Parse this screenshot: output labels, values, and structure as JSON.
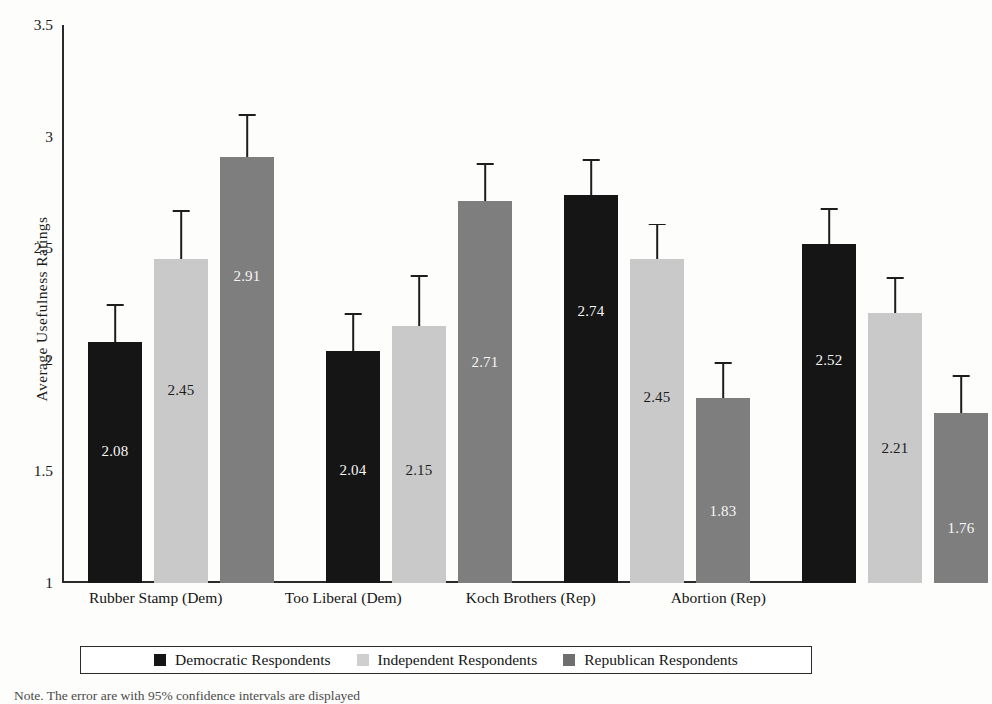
{
  "chart_data": {
    "type": "bar",
    "title": "",
    "xlabel": "",
    "ylabel": "Average Usefulness Ratings",
    "ylim": [
      1,
      3.5
    ],
    "yticks": [
      "1",
      "1.5",
      "2",
      "2.5",
      "3",
      "3.5"
    ],
    "grid": false,
    "legend_position": "bottom",
    "categories": [
      "Rubber Stamp (Dem)",
      "Too Liberal (Dem)",
      "Koch Brothers (Rep)",
      "Abortion (Rep)"
    ],
    "series": [
      {
        "name": "Democratic Respondents",
        "color": "#151515",
        "values": [
          2.08,
          2.04,
          2.74,
          2.52
        ],
        "labels": [
          "2.08",
          "2.04",
          "2.74",
          "2.52"
        ],
        "ci_low": [
          1.93,
          1.9,
          2.6,
          2.38
        ],
        "ci_high": [
          2.25,
          2.21,
          2.9,
          2.68
        ]
      },
      {
        "name": "Independent Respondents",
        "color": "#c9c9c9",
        "values": [
          2.45,
          2.15,
          2.45,
          2.21
        ],
        "labels": [
          "2.45",
          "2.15",
          "2.45",
          "2.21"
        ],
        "ci_low": [
          2.23,
          1.92,
          2.28,
          2.06
        ],
        "ci_high": [
          2.67,
          2.38,
          2.61,
          2.37
        ]
      },
      {
        "name": "Republican Respondents",
        "color": "#7e7e7e",
        "values": [
          2.91,
          2.71,
          1.83,
          1.76
        ],
        "labels": [
          "2.91",
          "2.71",
          "1.83",
          "1.76"
        ],
        "ci_low": [
          2.73,
          2.54,
          1.68,
          1.6
        ],
        "ci_high": [
          3.1,
          2.88,
          1.99,
          1.93
        ]
      }
    ]
  },
  "axis": {
    "y_title": "Average Usefulness Ratings",
    "ticks": [
      "3.5",
      "3",
      "2.5",
      "2",
      "1.5",
      "1"
    ]
  },
  "legend": {
    "items": [
      {
        "label": "Democratic Respondents"
      },
      {
        "label": "Independent Respondents"
      },
      {
        "label": "Republican Respondents"
      }
    ]
  },
  "note": {
    "text": "Note. The error are with 95% confidence intervals are displayed"
  }
}
